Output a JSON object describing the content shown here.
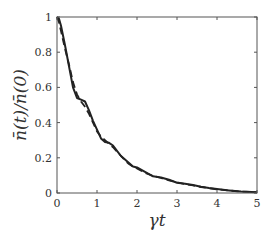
{
  "chart_data": {
    "type": "line",
    "title": "",
    "xlabel": "γt",
    "ylabel": "n̄(t)/n̄(0)",
    "xlim": [
      0,
      5
    ],
    "ylim": [
      0,
      1
    ],
    "grid": false,
    "legend": null,
    "x_ticks": [
      "0",
      "1",
      "2",
      "3",
      "4",
      "5"
    ],
    "y_ticks": [
      "0",
      "0.2",
      "0.4",
      "0.6",
      "0.8",
      "1"
    ],
    "series": [
      {
        "name": "solid",
        "style": "solid",
        "color": "#222222",
        "x": [
          0,
          0.05,
          0.1,
          0.2,
          0.3,
          0.4,
          0.5,
          0.6,
          0.7,
          0.8,
          0.9,
          1.0,
          1.1,
          1.2,
          1.3,
          1.4,
          1.5,
          1.6,
          1.7,
          1.8,
          1.9,
          2.0,
          2.2,
          2.4,
          2.6,
          2.8,
          3.0,
          3.2,
          3.4,
          3.6,
          3.8,
          4.0,
          4.3,
          4.6,
          5.0
        ],
        "values": [
          1.0,
          0.99,
          0.95,
          0.84,
          0.72,
          0.6,
          0.54,
          0.53,
          0.52,
          0.47,
          0.41,
          0.36,
          0.31,
          0.29,
          0.285,
          0.27,
          0.24,
          0.21,
          0.19,
          0.17,
          0.15,
          0.145,
          0.12,
          0.095,
          0.088,
          0.075,
          0.058,
          0.052,
          0.045,
          0.035,
          0.028,
          0.022,
          0.015,
          0.008,
          0.004
        ]
      },
      {
        "name": "dashed",
        "style": "dashed",
        "color": "#222222",
        "x": [
          0,
          0.05,
          0.1,
          0.2,
          0.3,
          0.4,
          0.5,
          0.6,
          0.7,
          0.8,
          0.9,
          1.0,
          1.1,
          1.2,
          1.3,
          1.4,
          1.5,
          1.6,
          1.7,
          1.8,
          1.9,
          2.0,
          2.2,
          2.4,
          2.6,
          2.8,
          3.0,
          3.2,
          3.4,
          3.6,
          3.8,
          4.0,
          4.3,
          4.6,
          5.0
        ],
        "values": [
          1.0,
          0.97,
          0.92,
          0.82,
          0.73,
          0.63,
          0.56,
          0.52,
          0.49,
          0.45,
          0.4,
          0.35,
          0.32,
          0.3,
          0.28,
          0.26,
          0.235,
          0.21,
          0.185,
          0.165,
          0.15,
          0.14,
          0.115,
          0.098,
          0.085,
          0.072,
          0.06,
          0.05,
          0.043,
          0.034,
          0.027,
          0.021,
          0.014,
          0.008,
          0.004
        ]
      }
    ]
  }
}
